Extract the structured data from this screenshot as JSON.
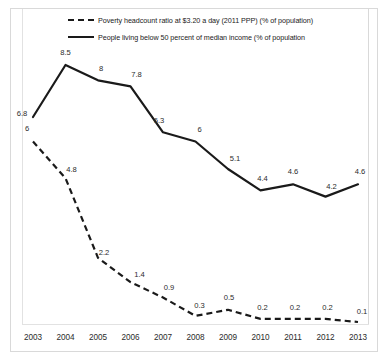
{
  "chart_data": {
    "type": "line",
    "title": "",
    "xlabel": "",
    "ylabel": "",
    "categories": [
      "2003",
      "2004",
      "2005",
      "2006",
      "2007",
      "2008",
      "2009",
      "2010",
      "2011",
      "2012",
      "2013"
    ],
    "grid": false,
    "legend_position": "top",
    "ylim": [
      0,
      9
    ],
    "series": [
      {
        "name": "Poverty headcount ratio at $3.20 a day (2011 PPP) (% of population)",
        "style": "dashed",
        "color": "#1a1a1a",
        "values": [
          6,
          4.8,
          2.2,
          1.4,
          0.9,
          0.3,
          0.5,
          0.2,
          0.2,
          0.2,
          0.1
        ],
        "labels": [
          "6",
          "4.8",
          "2.2",
          "1.4",
          "0.9",
          "0.3",
          "0.5",
          "0.2",
          "0.2",
          "0.2",
          "0.1"
        ]
      },
      {
        "name": "People living below 50 percent of median income (% of population",
        "style": "solid",
        "color": "#1a1a1a",
        "values": [
          6.8,
          8.5,
          8,
          7.8,
          6.3,
          6,
          5.1,
          4.4,
          4.6,
          4.2,
          4.6
        ],
        "labels": [
          "6.8",
          "8.5",
          "8",
          "7.8",
          "6.3",
          "6",
          "5.1",
          "4.4",
          "4.6",
          "4.2",
          "4.6"
        ]
      }
    ]
  },
  "legend": {
    "items": [
      {
        "label": "Poverty headcount ratio at $3.20 a day (2011 PPP) (% of population)",
        "style": "dashed"
      },
      {
        "label": "People living below 50 percent of median income (% of population",
        "style": "solid"
      }
    ]
  }
}
